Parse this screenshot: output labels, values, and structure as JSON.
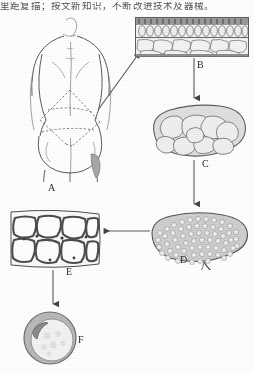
{
  "document": {
    "type": "medical-illustration-figure",
    "caption_line": "里距复描；按文新知识，不断改进技术及器械。"
  },
  "figure": {
    "panels": [
      {
        "id": "A",
        "label": "A",
        "name": "panel-a-donor-site-body",
        "description": "Line drawing of a female back and buttocks seen from behind, with dashed lines outlining the planned flap harvest area"
      },
      {
        "id": "B",
        "label": "B",
        "name": "panel-b-skin-cross-section",
        "description": "Histologic cross-section of skin: epidermis and dermis layer above, subcutaneous fat lobules below"
      },
      {
        "id": "C",
        "label": "C",
        "name": "panel-c-fat-lobule-mass",
        "description": "Oval mass of coarse fat lobules separated by fibrous septa"
      },
      {
        "id": "D",
        "label": "D",
        "name": "panel-d-fine-lobule-mass-with-pedicle",
        "description": "Oval mass of fine fat lobules with a vascular pedicle at the lower right"
      },
      {
        "id": "E",
        "label": "E",
        "name": "panel-e-adipocyte-block",
        "description": "High magnification block of adipose tissue showing individual fat cells"
      },
      {
        "id": "F",
        "label": "F",
        "name": "panel-f-single-adipocyte",
        "description": "Single adipocyte with a large lipid droplet and a crescent nucleus at the upper left"
      }
    ],
    "arrows": [
      {
        "name": "arrow-a-to-b",
        "from": "A",
        "to": "B",
        "direction": "diagonal-up-right"
      },
      {
        "name": "arrow-b-to-c",
        "from": "B",
        "to": "C",
        "direction": "down"
      },
      {
        "name": "arrow-c-to-d",
        "from": "C",
        "to": "D",
        "direction": "down"
      },
      {
        "name": "arrow-d-to-e",
        "from": "D",
        "to": "E",
        "direction": "left"
      },
      {
        "name": "arrow-e-to-f",
        "from": "E",
        "to": "F",
        "direction": "down"
      }
    ]
  },
  "colors": {
    "ink": "#4a4a4a",
    "ink_light": "#8d8d8d",
    "lobule_fill": "#e3e3e3",
    "lobule_fill_dark": "#c9c9c9",
    "septa": "#777777",
    "background": "#ffffff",
    "label_text": "#2a2a2a"
  }
}
